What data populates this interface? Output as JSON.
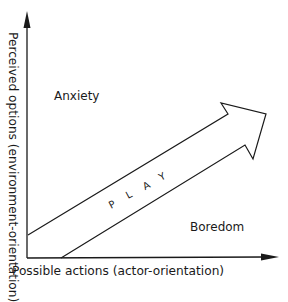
{
  "diagram": {
    "y_axis_label": "Perceived options (environment-orientation)",
    "x_axis_label": "Possible actions (actor-orientation)",
    "region_upper": "Anxiety",
    "region_lower": "Boredom",
    "arrow_label_letters": [
      "P",
      "L",
      "A",
      "Y"
    ],
    "arrow_label": "PLAY",
    "line_color": "#1a1a1a"
  }
}
